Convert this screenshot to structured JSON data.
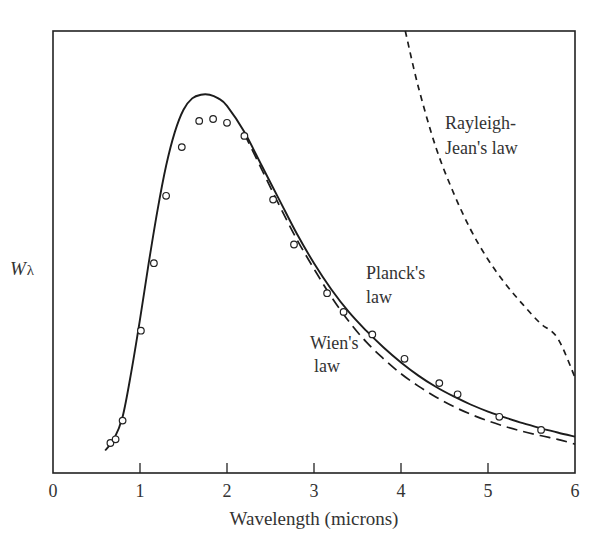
{
  "chart_data": {
    "type": "line",
    "title": "",
    "xlabel": "Wavelength (microns)",
    "ylabel": "W",
    "ylabel_subscript": "λ",
    "xlim": [
      0,
      6
    ],
    "ylim": [
      0,
      1.18
    ],
    "x_ticks": [
      "0",
      "1",
      "2",
      "3",
      "4",
      "5",
      "6"
    ],
    "y_ticks": [],
    "grid": false,
    "legend": "none (inline curve labels)",
    "series": [
      {
        "name": "Planck's law",
        "style": "solid",
        "x": [
          0.6,
          0.7,
          0.8,
          0.9,
          1.0,
          1.1,
          1.2,
          1.3,
          1.4,
          1.5,
          1.6,
          1.7,
          1.8,
          1.9,
          2.0,
          2.2,
          2.4,
          2.6,
          2.8,
          3.0,
          3.2,
          3.4,
          3.6,
          3.8,
          4.0,
          4.2,
          4.4,
          4.6,
          4.8,
          5.0,
          5.2,
          5.4,
          5.6,
          5.8,
          6.0
        ],
        "y": [
          0.06,
          0.09,
          0.15,
          0.27,
          0.41,
          0.56,
          0.7,
          0.82,
          0.91,
          0.97,
          1.0,
          1.01,
          1.01,
          1.0,
          0.98,
          0.91,
          0.82,
          0.73,
          0.64,
          0.56,
          0.49,
          0.43,
          0.38,
          0.335,
          0.295,
          0.26,
          0.23,
          0.205,
          0.183,
          0.164,
          0.148,
          0.133,
          0.12,
          0.108,
          0.097
        ]
      },
      {
        "name": "Wien's law",
        "style": "long-dashed",
        "x": [
          2.2,
          2.4,
          2.6,
          2.8,
          3.0,
          3.2,
          3.4,
          3.6,
          3.8,
          4.0,
          4.2,
          4.4,
          4.6,
          4.8,
          5.0,
          5.2,
          5.4,
          5.6,
          5.8,
          6.0
        ],
        "y": [
          0.905,
          0.81,
          0.715,
          0.625,
          0.545,
          0.47,
          0.405,
          0.35,
          0.305,
          0.265,
          0.232,
          0.203,
          0.178,
          0.157,
          0.139,
          0.124,
          0.111,
          0.1,
          0.09,
          0.077
        ]
      },
      {
        "name": "Rayleigh-Jean's law",
        "style": "short-dashed",
        "x": [
          4.05,
          4.2,
          4.4,
          4.6,
          4.8,
          5.0,
          5.2,
          5.4,
          5.6,
          5.8,
          6.0
        ],
        "y": [
          1.18,
          1.03,
          0.87,
          0.75,
          0.65,
          0.57,
          0.505,
          0.45,
          0.4,
          0.36,
          0.255
        ]
      },
      {
        "name": "Experimental data",
        "style": "open-circles",
        "x": [
          0.66,
          0.72,
          0.8,
          1.01,
          1.16,
          1.3,
          1.48,
          1.68,
          1.84,
          2.0,
          2.2,
          2.53,
          2.77,
          3.15,
          3.34,
          3.67,
          4.04,
          4.44,
          4.65,
          5.13,
          5.61
        ],
        "y": [
          0.08,
          0.09,
          0.14,
          0.38,
          0.56,
          0.74,
          0.87,
          0.94,
          0.945,
          0.935,
          0.9,
          0.73,
          0.61,
          0.48,
          0.43,
          0.37,
          0.305,
          0.24,
          0.21,
          0.15,
          0.115
        ]
      }
    ],
    "annotations": [
      {
        "text": "Rayleigh-",
        "line2": "Jean's law",
        "x": 4.5,
        "y": 0.83
      },
      {
        "text": "Planck's",
        "line2": "law",
        "x": 3.6,
        "y": 0.47
      },
      {
        "text": "Wien's",
        "line2": "law",
        "x": 2.95,
        "y": 0.32
      }
    ]
  },
  "labels": {
    "xlabel": "Wavelength (microns)",
    "ylabel_main": "W",
    "ylabel_sub": "λ",
    "rj_line1": "Rayleigh-",
    "rj_line2": "Jean's law",
    "planck_line1": "Planck's",
    "planck_line2": "law",
    "wien_line1": "Wien's",
    "wien_line2": "law",
    "ticks": [
      "0",
      "1",
      "2",
      "3",
      "4",
      "5",
      "6"
    ]
  },
  "colors": {
    "ink": "#222222",
    "background": "#ffffff"
  }
}
